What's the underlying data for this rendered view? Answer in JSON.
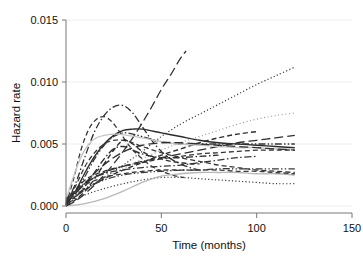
{
  "chart_data": {
    "type": "line",
    "title": "",
    "subtitle": "",
    "xlabel": "Time (months)",
    "ylabel": "Hazard rate",
    "xlim": [
      0,
      150
    ],
    "ylim": [
      0.0,
      0.015
    ],
    "xticks": [
      0,
      50,
      100,
      150
    ],
    "xtick_labels": [
      "0",
      "50",
      "100",
      "150"
    ],
    "yticks": [
      0.0,
      0.005,
      0.01,
      0.015
    ],
    "ytick_labels": [
      "0.000",
      "0.005",
      "0.010",
      "0.015"
    ],
    "grid": "horizontal",
    "legend": "none",
    "annotations": [],
    "series": [
      {
        "name": "curve-1-solid-overall",
        "style": "solid",
        "color": "#2b2b2b",
        "width": 1.4,
        "x": [
          0,
          5,
          10,
          15,
          20,
          25,
          30,
          35,
          40,
          50,
          60,
          70,
          80,
          90,
          100,
          110,
          120
        ],
        "y": [
          0.0001,
          0.0012,
          0.0027,
          0.004,
          0.005,
          0.0057,
          0.0061,
          0.0062,
          0.0062,
          0.0059,
          0.0056,
          0.0053,
          0.0051,
          0.005,
          0.0049,
          0.0048,
          0.0047
        ]
      },
      {
        "name": "curve-2-steep-longdash",
        "style": "longdash",
        "color": "#333333",
        "width": 1.3,
        "x": [
          0,
          5,
          10,
          15,
          20,
          25,
          30,
          35,
          40,
          45,
          50,
          55,
          60,
          63
        ],
        "y": [
          0.0,
          0.0004,
          0.001,
          0.0017,
          0.0025,
          0.0034,
          0.0044,
          0.0055,
          0.0067,
          0.008,
          0.0094,
          0.0106,
          0.0119,
          0.0125
        ]
      },
      {
        "name": "curve-3-dotted-rising",
        "style": "dotted",
        "color": "#3a3a3a",
        "width": 1.2,
        "x": [
          0,
          10,
          20,
          30,
          40,
          50,
          60,
          70,
          80,
          90,
          100,
          110,
          120
        ],
        "y": [
          0.0006,
          0.0014,
          0.0023,
          0.0033,
          0.0044,
          0.0056,
          0.0066,
          0.0074,
          0.0082,
          0.009,
          0.0098,
          0.0105,
          0.0112
        ]
      },
      {
        "name": "curve-4-lightdot-rising",
        "style": "fine-dotted",
        "color": "#9a9a9a",
        "width": 1.2,
        "x": [
          0,
          10,
          20,
          30,
          40,
          50,
          60,
          70,
          80,
          90,
          100,
          110,
          120
        ],
        "y": [
          0.0004,
          0.0013,
          0.0022,
          0.003,
          0.0038,
          0.0045,
          0.0051,
          0.0056,
          0.0061,
          0.0066,
          0.007,
          0.0073,
          0.0075
        ]
      },
      {
        "name": "curve-5-dashdot-peaked",
        "style": "dashdot",
        "color": "#2f2f2f",
        "width": 1.3,
        "x": [
          0,
          5,
          10,
          15,
          20,
          25,
          30,
          35,
          40,
          45,
          50,
          55,
          60,
          65,
          70
        ],
        "y": [
          0.0002,
          0.0018,
          0.004,
          0.006,
          0.0073,
          0.008,
          0.0081,
          0.0075,
          0.0064,
          0.0053,
          0.0044,
          0.0038,
          0.0034,
          0.0031,
          0.0029
        ]
      },
      {
        "name": "curve-6-dash-early-peak",
        "style": "dashed",
        "color": "#3a3a3a",
        "width": 1.3,
        "x": [
          0,
          4,
          8,
          12,
          16,
          20,
          24,
          28,
          34,
          40,
          46,
          52,
          58,
          62
        ],
        "y": [
          0.0001,
          0.0022,
          0.0046,
          0.0062,
          0.007,
          0.0072,
          0.0068,
          0.006,
          0.0047,
          0.0038,
          0.0031,
          0.0027,
          0.0024,
          0.0023
        ]
      },
      {
        "name": "curve-7-dashdotdot-midpeak",
        "style": "dashdotdot",
        "color": "#343434",
        "width": 1.3,
        "x": [
          0,
          5,
          10,
          15,
          20,
          25,
          30,
          35,
          40,
          50,
          60,
          70,
          80,
          90,
          100,
          110,
          120
        ],
        "y": [
          0.0002,
          0.0011,
          0.0024,
          0.0038,
          0.0049,
          0.0056,
          0.0059,
          0.0058,
          0.0056,
          0.0052,
          0.005,
          0.005,
          0.005,
          0.005,
          0.005,
          0.005,
          0.005
        ]
      },
      {
        "name": "curve-8-dash-declining",
        "style": "dashed",
        "color": "#383838",
        "width": 1.3,
        "x": [
          0,
          5,
          10,
          15,
          20,
          25,
          30,
          35,
          40,
          50,
          60,
          70,
          80,
          90,
          100,
          110,
          120
        ],
        "y": [
          0.0003,
          0.0016,
          0.0032,
          0.0043,
          0.005,
          0.0053,
          0.0053,
          0.0051,
          0.0048,
          0.0043,
          0.0039,
          0.0036,
          0.0033,
          0.0031,
          0.0029,
          0.0028,
          0.0027
        ]
      },
      {
        "name": "curve-9-longdash-up-right",
        "style": "longdash",
        "color": "#2e2e2e",
        "width": 1.3,
        "x": [
          0,
          10,
          20,
          30,
          40,
          50,
          60,
          70,
          80,
          90,
          100,
          110,
          120
        ],
        "y": [
          0.0005,
          0.0018,
          0.0027,
          0.0032,
          0.0036,
          0.0039,
          0.0042,
          0.0045,
          0.0048,
          0.0051,
          0.0053,
          0.0055,
          0.0057
        ]
      },
      {
        "name": "curve-10-dash-up-to-006",
        "style": "dashed",
        "color": "#303030",
        "width": 1.4,
        "x": [
          0,
          10,
          20,
          30,
          40,
          50,
          60,
          70,
          80,
          90,
          100
        ],
        "y": [
          0.0002,
          0.0013,
          0.0022,
          0.0029,
          0.0035,
          0.0041,
          0.0046,
          0.0051,
          0.0055,
          0.0058,
          0.006
        ]
      },
      {
        "name": "curve-11-dashdot-plateau",
        "style": "dashdot",
        "color": "#363636",
        "width": 1.3,
        "x": [
          0,
          10,
          20,
          30,
          40,
          50,
          60,
          70,
          80,
          90,
          100
        ],
        "y": [
          0.0004,
          0.0019,
          0.0026,
          0.0029,
          0.0031,
          0.0032,
          0.0033,
          0.0035,
          0.0037,
          0.0039,
          0.004
        ]
      },
      {
        "name": "curve-12-dotted-low-flat",
        "style": "dotted",
        "color": "#3d3d3d",
        "width": 1.2,
        "x": [
          0,
          10,
          20,
          30,
          40,
          50,
          60,
          70,
          80,
          90,
          100,
          110,
          120
        ],
        "y": [
          0.0002,
          0.0009,
          0.0014,
          0.0018,
          0.0021,
          0.0023,
          0.0023,
          0.0022,
          0.0021,
          0.002,
          0.0019,
          0.0018,
          0.0018
        ]
      },
      {
        "name": "curve-13-gray-late-rise",
        "style": "solid",
        "color": "#b8b8b8",
        "width": 1.3,
        "x": [
          0,
          10,
          20,
          30,
          40,
          50,
          60,
          70,
          80,
          90,
          100,
          110,
          120
        ],
        "y": [
          0.0,
          0.0002,
          0.0006,
          0.0012,
          0.0019,
          0.0024,
          0.0026,
          0.0027,
          0.0027,
          0.0027,
          0.0026,
          0.0026,
          0.0025
        ]
      },
      {
        "name": "curve-14-gray-early-rise",
        "style": "solid",
        "color": "#c4c4c4",
        "width": 1.3,
        "x": [
          0,
          4,
          8,
          12,
          16,
          20,
          26,
          32,
          40,
          50,
          60,
          70,
          80,
          90,
          100,
          110,
          120
        ],
        "y": [
          0.0005,
          0.0024,
          0.004,
          0.005,
          0.0055,
          0.0057,
          0.0058,
          0.0057,
          0.0055,
          0.0052,
          0.005,
          0.0049,
          0.0048,
          0.0047,
          0.0047,
          0.0046,
          0.0046
        ]
      },
      {
        "name": "curve-15-dash-crossing-down",
        "style": "dashed",
        "color": "#2d2d2d",
        "width": 1.4,
        "x": [
          0,
          5,
          10,
          15,
          20,
          25,
          30,
          35,
          40,
          45,
          50,
          55,
          60,
          65,
          70
        ],
        "y": [
          0.0,
          0.0005,
          0.0012,
          0.0022,
          0.0034,
          0.0045,
          0.0053,
          0.005,
          0.0044,
          0.004,
          0.0038,
          0.0036,
          0.0035,
          0.0034,
          0.0034
        ]
      },
      {
        "name": "curve-16-dashdot-steep-mid",
        "style": "dashdot",
        "color": "#313131",
        "width": 1.4,
        "x": [
          0,
          5,
          10,
          15,
          20,
          25,
          30,
          35,
          40,
          45,
          50,
          55,
          60,
          70,
          80
        ],
        "y": [
          0.0001,
          0.0007,
          0.0016,
          0.0027,
          0.0038,
          0.0046,
          0.0048,
          0.0045,
          0.0042,
          0.004,
          0.0039,
          0.0039,
          0.0039,
          0.004,
          0.0041
        ]
      },
      {
        "name": "curve-17-dash-shallow",
        "style": "dashed",
        "color": "#3b3b3b",
        "width": 1.3,
        "x": [
          0,
          10,
          20,
          30,
          40,
          50,
          60,
          70,
          80,
          90,
          100,
          110,
          120
        ],
        "y": [
          0.0006,
          0.0017,
          0.0023,
          0.0026,
          0.0028,
          0.0029,
          0.0029,
          0.0029,
          0.0029,
          0.0028,
          0.0028,
          0.0027,
          0.0026
        ]
      },
      {
        "name": "curve-18-dashdotdot-low",
        "style": "dashdotdot",
        "color": "#383838",
        "width": 1.3,
        "x": [
          0,
          10,
          20,
          30,
          40,
          50,
          60,
          70,
          80,
          90,
          100,
          110,
          120
        ],
        "y": [
          0.0003,
          0.0014,
          0.0021,
          0.0025,
          0.0027,
          0.0028,
          0.0029,
          0.0029,
          0.003,
          0.003,
          0.003,
          0.003,
          0.003
        ]
      },
      {
        "name": "curve-19-dash-rise-to-045",
        "style": "dashed",
        "color": "#343434",
        "width": 1.3,
        "x": [
          0,
          10,
          20,
          30,
          40,
          50,
          60,
          70,
          80,
          90,
          100,
          110,
          120
        ],
        "y": [
          0.0004,
          0.0021,
          0.0028,
          0.0032,
          0.0035,
          0.0038,
          0.004,
          0.0042,
          0.0043,
          0.0044,
          0.0045,
          0.0045,
          0.0045
        ]
      },
      {
        "name": "curve-20-longdash-mid-band",
        "style": "longdash",
        "color": "#2f2f2f",
        "width": 1.3,
        "x": [
          0,
          8,
          16,
          24,
          32,
          40,
          50,
          60,
          70,
          80,
          90,
          100,
          110,
          120
        ],
        "y": [
          0.0002,
          0.0015,
          0.0028,
          0.0038,
          0.0045,
          0.0049,
          0.0051,
          0.0051,
          0.005,
          0.0049,
          0.0048,
          0.0047,
          0.0046,
          0.0045
        ]
      }
    ]
  },
  "axes": {
    "y_axis_title": "Hazard rate",
    "x_axis_title": "Time (months)"
  },
  "style_colors": {
    "axis": "#666666",
    "gridline": "#eeeeee",
    "tick_label": "#111111",
    "background": "#ffffff"
  }
}
